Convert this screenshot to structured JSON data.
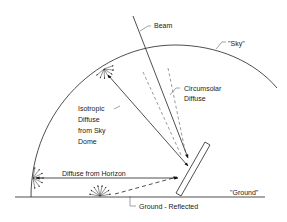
{
  "diagram": {
    "labels": {
      "beam": "Beam",
      "sky": "\"Sky\"",
      "circumsolar_line1": "Circumsolar",
      "circumsolar_line2": "Diffuse",
      "isotropic_line1": "Isotropic",
      "isotropic_line2": "Diffuse",
      "isotropic_line3": "from Sky",
      "isotropic_line4": "Dome",
      "horizon": "Diffuse from Horizon",
      "ground": "\"Ground\"",
      "ground_reflected": "Ground - Reflected"
    },
    "colors": {
      "line": "#222222",
      "background": "#ffffff"
    }
  }
}
